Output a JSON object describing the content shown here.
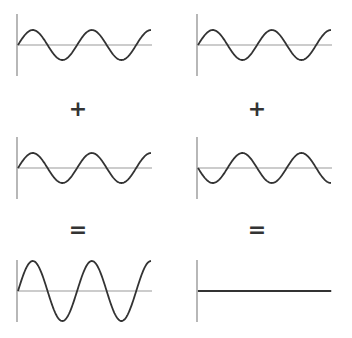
{
  "diagram": {
    "colors": {
      "wave": "#333333",
      "axis": "#888888",
      "baseline": "#999999",
      "operator": "#333333"
    },
    "operators": {
      "left_plus": "+",
      "right_plus": "+",
      "left_equals": "=",
      "right_equals": "="
    },
    "columns": [
      {
        "name": "constructive",
        "waves": [
          {
            "name": "wave-a",
            "amplitude": 1,
            "phase_deg": 0
          },
          {
            "name": "wave-b",
            "amplitude": 1,
            "phase_deg": 0
          },
          {
            "name": "sum",
            "amplitude": 2,
            "phase_deg": 0
          }
        ]
      },
      {
        "name": "destructive",
        "waves": [
          {
            "name": "wave-a",
            "amplitude": 1,
            "phase_deg": 0
          },
          {
            "name": "wave-b",
            "amplitude": 1,
            "phase_deg": 180
          },
          {
            "name": "sum",
            "amplitude": 0,
            "phase_deg": 0
          }
        ]
      }
    ],
    "cycles_shown": 2.25
  }
}
